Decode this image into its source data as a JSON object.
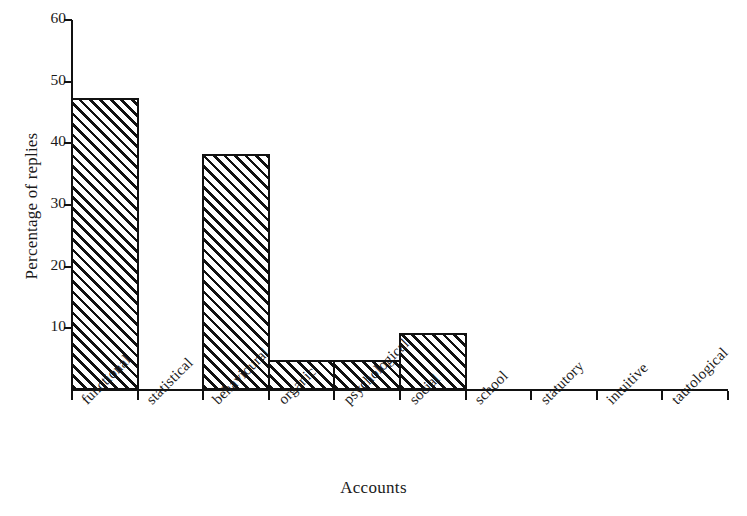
{
  "chart_data": {
    "type": "bar",
    "title": "",
    "xlabel": "Accounts",
    "ylabel": "Percentage of replies",
    "categories": [
      "functional",
      "statistical",
      "behavioural",
      "organic",
      "psychological",
      "social",
      "school",
      "statutory",
      "intuitive",
      "tautological"
    ],
    "values": [
      47,
      0,
      38,
      4.5,
      4.5,
      9,
      0,
      0,
      0,
      0
    ],
    "ylim": [
      0,
      60
    ],
    "ytick_labels": [
      "10",
      "20",
      "30",
      "40",
      "50",
      "60"
    ],
    "ytick_values": [
      10,
      20,
      30,
      40,
      50,
      60
    ],
    "grid": false,
    "legend": null,
    "bar_style": "diagonal-hatch-black-on-white",
    "colors": {
      "ink": "#111111",
      "paper": "#ffffff"
    }
  }
}
